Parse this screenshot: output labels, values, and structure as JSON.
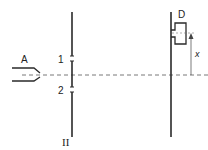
{
  "diagram": {
    "type": "double-slit-experiment",
    "labels": {
      "source": "A",
      "slit_1": "1",
      "slit_2": "2",
      "wall": "II",
      "detector": "D",
      "displacement": "x"
    },
    "colors": {
      "line": "#2a2a2a",
      "dashed": "#555555",
      "background": "#ffffff"
    }
  }
}
